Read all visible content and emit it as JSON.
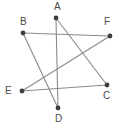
{
  "figure": {
    "type": "point-and-line-diagram",
    "title": "",
    "background_color": "#ffffff",
    "line_color": "#8a8a8a",
    "dot_color": "#3d3d3d",
    "label_color": "#4a4a4a",
    "canvas": {
      "width": 120,
      "height": 129
    },
    "vertices": [
      {
        "id": "A",
        "label": "A",
        "x": 56,
        "y": 18,
        "label_x": 54,
        "label_y": 2
      },
      {
        "id": "B",
        "label": "B",
        "x": 23,
        "y": 33,
        "label_x": 20,
        "label_y": 17
      },
      {
        "id": "C",
        "label": "C",
        "x": 107,
        "y": 85,
        "label_x": 103,
        "label_y": 91
      },
      {
        "id": "D",
        "label": "D",
        "x": 58,
        "y": 108,
        "label_x": 55,
        "label_y": 114
      },
      {
        "id": "E",
        "label": "E",
        "x": 22,
        "y": 91,
        "label_x": 5,
        "label_y": 86
      },
      {
        "id": "F",
        "label": "F",
        "x": 110,
        "y": 36,
        "label_x": 104,
        "label_y": 17
      }
    ],
    "edges": [
      {
        "id": "AD",
        "from": "A",
        "to": "D",
        "label": "A to D"
      },
      {
        "id": "AC",
        "from": "A",
        "to": "C",
        "label": "A to C"
      },
      {
        "id": "BF",
        "from": "B",
        "to": "F",
        "label": "B to F"
      },
      {
        "id": "BD",
        "from": "B",
        "to": "D",
        "label": "B to D"
      },
      {
        "id": "EC",
        "from": "E",
        "to": "C",
        "label": "E to C"
      },
      {
        "id": "EF",
        "from": "E",
        "to": "F",
        "label": "E to F"
      }
    ]
  }
}
